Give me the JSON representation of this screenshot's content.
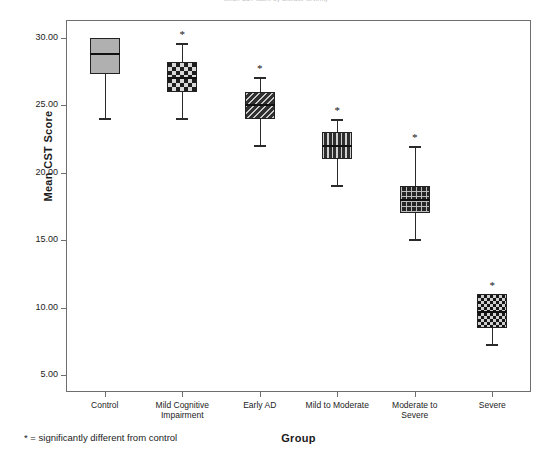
{
  "chart_data": {
    "type": "box",
    "title": "Mean CST score by disease severity",
    "xlabel": "Group",
    "ylabel": "Mean CST Score",
    "ylim": [
      4.0,
      31.5
    ],
    "yticks": [
      "5.00",
      "10.00",
      "15.00",
      "20.00",
      "25.00",
      "30.00"
    ],
    "ytick_values": [
      5,
      10,
      15,
      20,
      25,
      30
    ],
    "grid": false,
    "legend": "none",
    "footnote": "* = significantly different from control",
    "significance_marker": "*",
    "categories": [
      "Control",
      "Mild Cognitive\nImpairment",
      "Early AD",
      "Mild to Moderate",
      "Moderate to\nSevere",
      "Severe"
    ],
    "boxes": [
      {
        "group": "Control",
        "whisker_low": 24.0,
        "q1": 27.3,
        "median": 28.8,
        "q3": 30.0,
        "whisker_high": 30.0,
        "significant": false,
        "fill": "solid-gray",
        "fill_color": "#b0b0b0"
      },
      {
        "group": "Mild Cognitive Impairment",
        "whisker_low": 24.0,
        "q1": 26.0,
        "median": 27.0,
        "q3": 28.2,
        "whisker_high": 29.6,
        "significant": true,
        "fill": "checker",
        "fill_color": "#1e1e1e"
      },
      {
        "group": "Early AD",
        "whisker_low": 22.0,
        "q1": 24.0,
        "median": 25.0,
        "q3": 26.0,
        "whisker_high": 27.1,
        "significant": true,
        "fill": "diagonal",
        "fill_color": "#3a3a3a"
      },
      {
        "group": "Mild to Moderate",
        "whisker_low": 19.0,
        "q1": 21.0,
        "median": 22.0,
        "q3": 23.0,
        "whisker_high": 24.0,
        "significant": true,
        "fill": "vertical",
        "fill_color": "#3a3a3a"
      },
      {
        "group": "Moderate to Severe",
        "whisker_low": 15.0,
        "q1": 17.0,
        "median": 18.0,
        "q3": 19.0,
        "whisker_high": 22.0,
        "significant": true,
        "fill": "grid",
        "fill_color": "#262626"
      },
      {
        "group": "Severe",
        "whisker_low": 7.2,
        "q1": 8.5,
        "median": 9.7,
        "q3": 11.0,
        "whisker_high": 11.0,
        "significant": true,
        "fill": "checker-fine",
        "fill_color": "#171717"
      }
    ]
  }
}
